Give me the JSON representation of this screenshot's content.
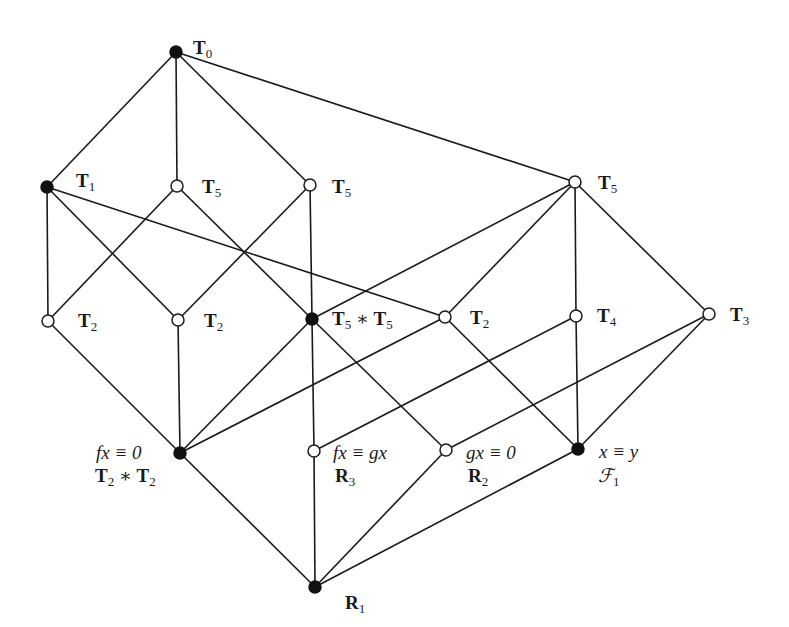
{
  "diagram": {
    "type": "lattice",
    "nodes": [
      {
        "id": "T0",
        "x": 176,
        "y": 52,
        "filled": true,
        "label": {
          "main": "T",
          "sub": "0"
        },
        "label_pos": [
          193,
          38
        ]
      },
      {
        "id": "T1",
        "x": 47,
        "y": 187,
        "filled": true,
        "label": {
          "main": "T",
          "sub": "1"
        },
        "label_pos": [
          76,
          170
        ]
      },
      {
        "id": "T5a",
        "x": 177,
        "y": 186,
        "filled": false,
        "label": {
          "main": "T",
          "sub": "5"
        },
        "label_pos": [
          202,
          177
        ]
      },
      {
        "id": "T5b",
        "x": 310,
        "y": 185,
        "filled": false,
        "label": {
          "main": "T",
          "sub": "5"
        },
        "label_pos": [
          332,
          177
        ]
      },
      {
        "id": "T5c",
        "x": 575,
        "y": 182,
        "filled": false,
        "label": {
          "main": "T",
          "sub": "5"
        },
        "label_pos": [
          598,
          173
        ]
      },
      {
        "id": "T2a",
        "x": 48,
        "y": 321,
        "filled": false,
        "label": {
          "main": "T",
          "sub": "2"
        },
        "label_pos": [
          78,
          311
        ]
      },
      {
        "id": "T2b",
        "x": 178,
        "y": 320,
        "filled": false,
        "label": {
          "main": "T",
          "sub": "2"
        },
        "label_pos": [
          204,
          311
        ]
      },
      {
        "id": "T55",
        "x": 312,
        "y": 319,
        "filled": true,
        "label": {
          "main": "T",
          "sub": "5",
          "op": " ∗ ",
          "main2": "T",
          "sub2": "5"
        },
        "label_pos": [
          331,
          309
        ]
      },
      {
        "id": "T2c",
        "x": 445,
        "y": 317,
        "filled": false,
        "label": {
          "main": "T",
          "sub": "2"
        },
        "label_pos": [
          470,
          308
        ]
      },
      {
        "id": "T4",
        "x": 576,
        "y": 316,
        "filled": false,
        "label": {
          "main": "T",
          "sub": "4"
        },
        "label_pos": [
          597,
          306
        ]
      },
      {
        "id": "T3",
        "x": 709,
        "y": 314,
        "filled": false,
        "label": {
          "main": "T",
          "sub": "3"
        },
        "label_pos": [
          730,
          305
        ]
      },
      {
        "id": "fx0",
        "x": 180,
        "y": 453,
        "filled": true,
        "label": {
          "line1": "fx ≡ 0",
          "line2_main": "T",
          "line2_sub": "2",
          "line2_op": " ∗ ",
          "line2_main2": "T",
          "line2_sub2": "2"
        },
        "label_pos": [
          95,
          443
        ]
      },
      {
        "id": "fxgx",
        "x": 314,
        "y": 451,
        "filled": false,
        "label": {
          "line1": "fx ≡ gx",
          "line2_main": "R",
          "line2_sub": "3"
        },
        "label_pos": [
          333,
          443
        ]
      },
      {
        "id": "gx0",
        "x": 446,
        "y": 450,
        "filled": false,
        "label": {
          "line1": "gx ≡ 0",
          "line2_main": "R",
          "line2_sub": "2"
        },
        "label_pos": [
          466,
          443
        ]
      },
      {
        "id": "xy",
        "x": 578,
        "y": 449,
        "filled": true,
        "label": {
          "line1": "x ≡ y",
          "line2_script": "ℱ",
          "line2_sub": "1"
        },
        "label_pos": [
          598,
          443
        ]
      },
      {
        "id": "R1",
        "x": 315,
        "y": 587,
        "filled": true,
        "label": {
          "main": "R",
          "sub": "1"
        },
        "label_pos": [
          345,
          593
        ]
      }
    ],
    "edges": [
      [
        "T0",
        "T1"
      ],
      [
        "T0",
        "T5a"
      ],
      [
        "T0",
        "T5b"
      ],
      [
        "T0",
        "T5c"
      ],
      [
        "T1",
        "T2a"
      ],
      [
        "T1",
        "T2b"
      ],
      [
        "T1",
        "T2c"
      ],
      [
        "T5a",
        "T2a"
      ],
      [
        "T5a",
        "T55"
      ],
      [
        "T5b",
        "T2b"
      ],
      [
        "T5b",
        "T55"
      ],
      [
        "T5c",
        "T55"
      ],
      [
        "T5c",
        "T2c"
      ],
      [
        "T5c",
        "T4"
      ],
      [
        "T5c",
        "T3"
      ],
      [
        "T2a",
        "fx0"
      ],
      [
        "T2b",
        "fx0"
      ],
      [
        "T55",
        "fx0"
      ],
      [
        "T2c",
        "fx0"
      ],
      [
        "T55",
        "fxgx"
      ],
      [
        "T55",
        "gx0"
      ],
      [
        "T2c",
        "xy"
      ],
      [
        "T4",
        "fxgx"
      ],
      [
        "T4",
        "xy"
      ],
      [
        "T3",
        "gx0"
      ],
      [
        "T3",
        "xy"
      ],
      [
        "fx0",
        "R1"
      ],
      [
        "fxgx",
        "R1"
      ],
      [
        "gx0",
        "R1"
      ],
      [
        "xy",
        "R1"
      ]
    ]
  },
  "labels": {
    "T0": {
      "main": "T",
      "sub": "0"
    },
    "T1": {
      "main": "T",
      "sub": "1"
    },
    "T5a": {
      "main": "T",
      "sub": "5"
    },
    "T5b": {
      "main": "T",
      "sub": "5"
    },
    "T5c": {
      "main": "T",
      "sub": "5"
    },
    "T2a": {
      "main": "T",
      "sub": "2"
    },
    "T2b": {
      "main": "T",
      "sub": "2"
    },
    "T55": {
      "main": "T",
      "sub": "5",
      "op": "∗",
      "main2": "T",
      "sub2": "5"
    },
    "T2c": {
      "main": "T",
      "sub": "2"
    },
    "T4": {
      "main": "T",
      "sub": "4"
    },
    "T3": {
      "main": "T",
      "sub": "3"
    },
    "fx0": {
      "line1": "fx ≡ 0",
      "main": "T",
      "sub": "2",
      "op": "∗",
      "main2": "T",
      "sub2": "2"
    },
    "fxgx": {
      "line1": "fx ≡ gx",
      "main": "R",
      "sub": "3"
    },
    "gx0": {
      "line1": "gx ≡ 0",
      "main": "R",
      "sub": "2"
    },
    "xy": {
      "line1": "x ≡ y",
      "main": "ℱ",
      "sub": "1"
    },
    "R1": {
      "main": "R",
      "sub": "1"
    }
  }
}
